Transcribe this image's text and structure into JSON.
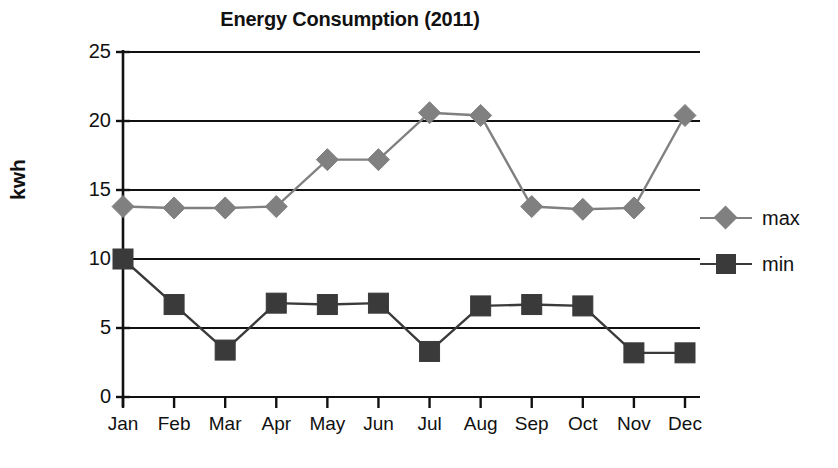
{
  "chart_data": {
    "type": "line",
    "title": "Energy Consumption (2011)",
    "xlabel": "",
    "ylabel": "kwh",
    "categories": [
      "Jan",
      "Feb",
      "Mar",
      "Apr",
      "May",
      "Jun",
      "Jul",
      "Aug",
      "Sep",
      "Oct",
      "Nov",
      "Dec"
    ],
    "series": [
      {
        "name": "max",
        "marker": "diamond",
        "color": "#808080",
        "values": [
          13.8,
          13.7,
          13.7,
          13.8,
          17.2,
          17.2,
          20.6,
          20.4,
          13.8,
          13.6,
          13.7,
          20.4
        ]
      },
      {
        "name": "min",
        "marker": "square",
        "color": "#3a3a3a",
        "values": [
          10.0,
          6.7,
          3.4,
          6.8,
          6.7,
          6.8,
          3.3,
          6.6,
          6.7,
          6.6,
          3.2,
          3.2
        ]
      }
    ],
    "ylim": [
      0,
      25
    ],
    "yticks": [
      0,
      5,
      10,
      15,
      20,
      25
    ],
    "ytick_labels": [
      "0",
      "5",
      "10",
      "15",
      "20",
      "25"
    ],
    "grid": "horizontal",
    "legend_position": "right"
  },
  "axis": {
    "y_title": "kwh",
    "y_ticks": [
      "25",
      "20",
      "15",
      "10",
      "5",
      "0"
    ],
    "x_ticks": [
      "Jan",
      "Feb",
      "Mar",
      "Apr",
      "May",
      "Jun",
      "Jul",
      "Aug",
      "Sep",
      "Oct",
      "Nov",
      "Dec"
    ]
  },
  "legend": {
    "entries": [
      {
        "label": "max",
        "color": "#808080",
        "marker": "diamond"
      },
      {
        "label": "min",
        "color": "#3a3a3a",
        "marker": "square"
      }
    ]
  },
  "colors": {
    "max_series": "#808080",
    "min_series": "#3a3a3a",
    "axis": "#111111",
    "grid": "#111111",
    "background": "#ffffff"
  }
}
